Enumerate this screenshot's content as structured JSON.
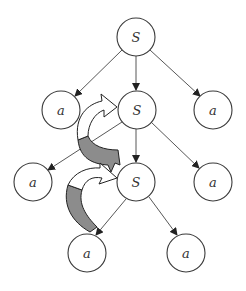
{
  "diagram": {
    "type": "derivation-tree",
    "nodes": [
      {
        "id": "n1",
        "label": "S",
        "x": 136,
        "y": 37
      },
      {
        "id": "n2",
        "label": "a",
        "x": 61,
        "y": 110
      },
      {
        "id": "n3",
        "label": "S",
        "x": 137,
        "y": 110
      },
      {
        "id": "n4",
        "label": "a",
        "x": 213,
        "y": 110
      },
      {
        "id": "n5",
        "label": "a",
        "x": 33,
        "y": 182
      },
      {
        "id": "n6",
        "label": "S",
        "x": 136,
        "y": 182
      },
      {
        "id": "n7",
        "label": "a",
        "x": 213,
        "y": 182
      },
      {
        "id": "n8",
        "label": "a",
        "x": 87,
        "y": 253
      },
      {
        "id": "n9",
        "label": "a",
        "x": 186,
        "y": 253
      }
    ],
    "edges": [
      {
        "from": "n1",
        "to": "n2"
      },
      {
        "from": "n1",
        "to": "n3"
      },
      {
        "from": "n1",
        "to": "n4"
      },
      {
        "from": "n3",
        "to": "n5"
      },
      {
        "from": "n3",
        "to": "n6"
      },
      {
        "from": "n3",
        "to": "n7"
      },
      {
        "from": "n6",
        "to": "n8"
      },
      {
        "from": "n6",
        "to": "n9"
      }
    ],
    "curved_arrows": [
      {
        "from": "n6",
        "to": "n3",
        "style": "gray-to-white u-turn"
      },
      {
        "from": "n8",
        "to": "n6",
        "style": "gray-to-white u-turn"
      }
    ],
    "colors": {
      "stroke": "#3a3a3a",
      "band_fill": "#8c8c8c",
      "background": "#ffffff"
    }
  }
}
